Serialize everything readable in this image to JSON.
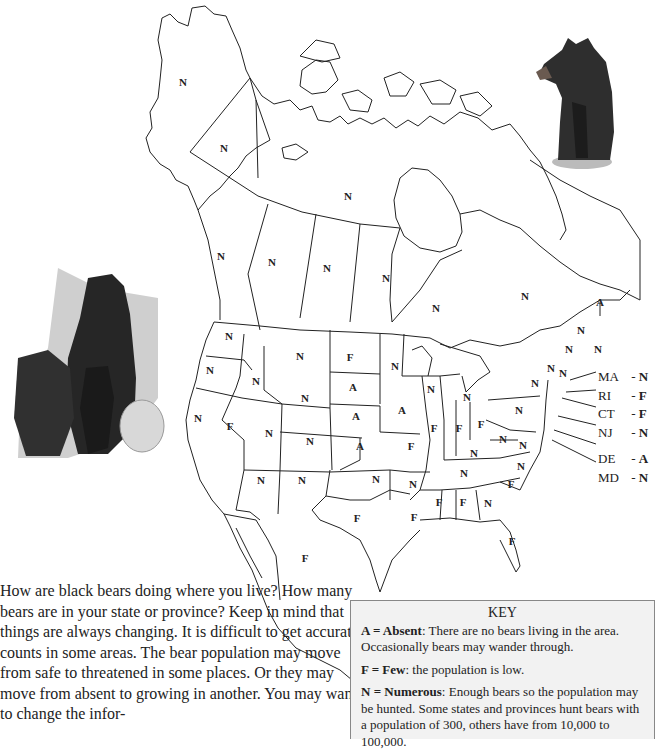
{
  "map": {
    "title_fragment": "",
    "regions": [
      {
        "name": "Alaska",
        "code": "AK",
        "status": "N",
        "x": 183,
        "y": 82
      },
      {
        "name": "Yukon",
        "code": "YT",
        "status": "N",
        "x": 224,
        "y": 148
      },
      {
        "name": "Northwest Territories / Nunavut",
        "code": "NT",
        "status": "N",
        "x": 348,
        "y": 196
      },
      {
        "name": "British Columbia",
        "code": "BC",
        "status": "N",
        "x": 221,
        "y": 256
      },
      {
        "name": "Alberta",
        "code": "AB",
        "status": "N",
        "x": 272,
        "y": 262
      },
      {
        "name": "Saskatchewan",
        "code": "SK",
        "status": "N",
        "x": 327,
        "y": 268
      },
      {
        "name": "Manitoba",
        "code": "MB",
        "status": "N",
        "x": 386,
        "y": 278
      },
      {
        "name": "Ontario",
        "code": "ON",
        "status": "N",
        "x": 436,
        "y": 308
      },
      {
        "name": "Quebec",
        "code": "QC",
        "status": "N",
        "x": 525,
        "y": 296
      },
      {
        "name": "Prince Edward Island",
        "code": "PE",
        "status": "A",
        "x": 600,
        "y": 302
      },
      {
        "name": "New Brunswick",
        "code": "NB",
        "status": "N",
        "x": 581,
        "y": 330
      },
      {
        "name": "Nova Scotia",
        "code": "NS",
        "status": "N",
        "x": 598,
        "y": 349
      },
      {
        "name": "Maine",
        "code": "ME",
        "status": "N",
        "x": 569,
        "y": 349
      },
      {
        "name": "New Hampshire",
        "code": "NH",
        "status": "N",
        "x": 551,
        "y": 368
      },
      {
        "name": "Vermont",
        "code": "VT",
        "status": "N",
        "x": 563,
        "y": 373
      },
      {
        "name": "Washington",
        "code": "WA",
        "status": "N",
        "x": 229,
        "y": 336
      },
      {
        "name": "Oregon",
        "code": "OR",
        "status": "N",
        "x": 210,
        "y": 370
      },
      {
        "name": "Idaho",
        "code": "ID",
        "status": "N",
        "x": 256,
        "y": 381
      },
      {
        "name": "Montana",
        "code": "MT",
        "status": "N",
        "x": 300,
        "y": 356
      },
      {
        "name": "North Dakota",
        "code": "ND",
        "status": "F",
        "x": 350,
        "y": 357
      },
      {
        "name": "South Dakota",
        "code": "SD",
        "status": "A",
        "x": 353,
        "y": 387
      },
      {
        "name": "Wyoming",
        "code": "WY",
        "status": "N",
        "x": 305,
        "y": 398
      },
      {
        "name": "Nebraska",
        "code": "NE",
        "status": "A",
        "x": 356,
        "y": 416
      },
      {
        "name": "Kansas",
        "code": "KS",
        "status": "A",
        "x": 360,
        "y": 446
      },
      {
        "name": "California",
        "code": "CA",
        "status": "N",
        "x": 198,
        "y": 418
      },
      {
        "name": "Nevada",
        "code": "NV",
        "status": "F",
        "x": 230,
        "y": 426
      },
      {
        "name": "Utah",
        "code": "UT",
        "status": "N",
        "x": 269,
        "y": 433
      },
      {
        "name": "Colorado",
        "code": "CO",
        "status": "N",
        "x": 310,
        "y": 441
      },
      {
        "name": "Arizona",
        "code": "AZ",
        "status": "N",
        "x": 261,
        "y": 480
      },
      {
        "name": "New Mexico",
        "code": "NM",
        "status": "N",
        "x": 302,
        "y": 480
      },
      {
        "name": "Oklahoma",
        "code": "OK",
        "status": "N",
        "x": 376,
        "y": 479
      },
      {
        "name": "Texas",
        "code": "TX",
        "status": "F",
        "x": 357,
        "y": 518
      },
      {
        "name": "Minnesota",
        "code": "MN",
        "status": "N",
        "x": 395,
        "y": 366
      },
      {
        "name": "Iowa",
        "code": "IA",
        "status": "A",
        "x": 402,
        "y": 410
      },
      {
        "name": "Missouri",
        "code": "MO",
        "status": "F",
        "x": 411,
        "y": 446
      },
      {
        "name": "Arkansas",
        "code": "AR",
        "status": "N",
        "x": 413,
        "y": 484
      },
      {
        "name": "Louisiana",
        "code": "LA",
        "status": "F",
        "x": 414,
        "y": 517
      },
      {
        "name": "Wisconsin",
        "code": "WI",
        "status": "N",
        "x": 431,
        "y": 389
      },
      {
        "name": "Illinois",
        "code": "IL",
        "status": "F",
        "x": 434,
        "y": 428
      },
      {
        "name": "Michigan",
        "code": "MI",
        "status": "N",
        "x": 467,
        "y": 397
      },
      {
        "name": "Indiana",
        "code": "IN",
        "status": "F",
        "x": 459,
        "y": 428
      },
      {
        "name": "Ohio",
        "code": "OH",
        "status": "F",
        "x": 481,
        "y": 424
      },
      {
        "name": "Kentucky",
        "code": "KY",
        "status": "N",
        "x": 474,
        "y": 453
      },
      {
        "name": "Tennessee",
        "code": "TN",
        "status": "N",
        "x": 464,
        "y": 473
      },
      {
        "name": "Mississippi",
        "code": "MS",
        "status": "F",
        "x": 439,
        "y": 502
      },
      {
        "name": "Alabama",
        "code": "AL",
        "status": "F",
        "x": 463,
        "y": 502
      },
      {
        "name": "Georgia",
        "code": "GA",
        "status": "N",
        "x": 488,
        "y": 503
      },
      {
        "name": "Florida",
        "code": "FL",
        "status": "F",
        "x": 512,
        "y": 541
      },
      {
        "name": "South Carolina",
        "code": "SC",
        "status": "F",
        "x": 511,
        "y": 484
      },
      {
        "name": "North Carolina",
        "code": "NC",
        "status": "N",
        "x": 521,
        "y": 466
      },
      {
        "name": "West Virginia",
        "code": "WV",
        "status": "N",
        "x": 503,
        "y": 439
      },
      {
        "name": "Virginia",
        "code": "VA",
        "status": "N",
        "x": 523,
        "y": 445
      },
      {
        "name": "Pennsylvania",
        "code": "PA",
        "status": "N",
        "x": 519,
        "y": 410
      },
      {
        "name": "New York",
        "code": "NY",
        "status": "N",
        "x": 535,
        "y": 383
      },
      {
        "name": "Mexico",
        "code": "MX",
        "status": "F",
        "x": 305,
        "y": 558
      }
    ],
    "northeast_callouts": [
      {
        "abbr": "MA",
        "status": "N"
      },
      {
        "abbr": "RI",
        "status": "F"
      },
      {
        "abbr": "CT",
        "status": "F"
      },
      {
        "abbr": "NJ",
        "status": "N"
      },
      {
        "abbr": "DE",
        "status": "A"
      },
      {
        "abbr": "MD",
        "status": "N"
      }
    ]
  },
  "intro_text": "How are black bears doing where you live? How many bears are in your state or province? Keep in mind that things are always changing. It is difficult to get accurate counts in some areas. The bear population may move from safe to threatened in some places. Or they may move from absent to growing in another. You may want to change the infor-",
  "key": {
    "title": "KEY",
    "entries": [
      {
        "term": "A = Absent",
        "desc": ": There are no bears living in the area. Occasionally bears may wander through."
      },
      {
        "term": "F = Few",
        "desc": ": the population is low."
      },
      {
        "term": "N = Numerous",
        "desc": ": Enough bears so the population may be hunted. Some states and provinces hunt bears with a population of 300, others have from 10,000 to 100,000."
      }
    ]
  },
  "images": {
    "bear_cub": "black-bear-cub-illustration",
    "bear_family": "black-bear-mother-with-cubs-illustration"
  }
}
